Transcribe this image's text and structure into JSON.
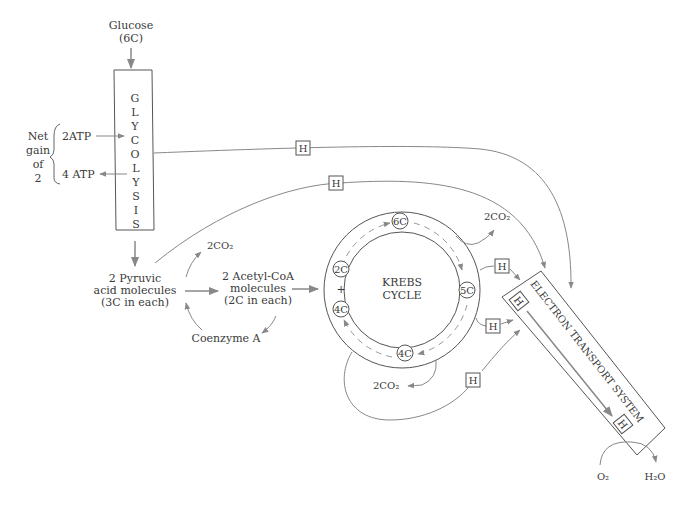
{
  "glucose": {
    "line1": "Glucose",
    "line2": "(6C)"
  },
  "glycolysis": {
    "letters": [
      "G",
      "L",
      "Y",
      "C",
      "O",
      "L",
      "Y",
      "S",
      "I",
      "S"
    ]
  },
  "atp": {
    "net_gain": [
      "Net",
      "gain",
      "of",
      "2"
    ],
    "input": "2ATP",
    "output": "4 ATP"
  },
  "pyruvic": {
    "line1": "2 Pyruvic",
    "line2": "acid molecules",
    "line3": "(3C in each)"
  },
  "acetyl": {
    "line1": "2 Acetyl-CoA",
    "line2": "molecules",
    "line3": "(2C in each)"
  },
  "co2_pyruvate": "2CO₂",
  "coenzyme": "Coenzyme A",
  "krebs": {
    "line1": "KREBS",
    "line2": "CYCLE",
    "nodes": {
      "six": "6C",
      "five": "5C",
      "four_bottom": "4C",
      "two": "2C",
      "plus": "+",
      "four_left": "4C"
    },
    "co2_top": "2CO₂",
    "co2_bottom": "2CO₂"
  },
  "hydrogen": "H",
  "ets": {
    "label": "ELECTRON TRANSPORT SYSTEM"
  },
  "oxygen": "O₂",
  "water": "H₂O",
  "colors": {
    "line": "#888888",
    "box": "#555555",
    "text": "#3a3a3a"
  }
}
